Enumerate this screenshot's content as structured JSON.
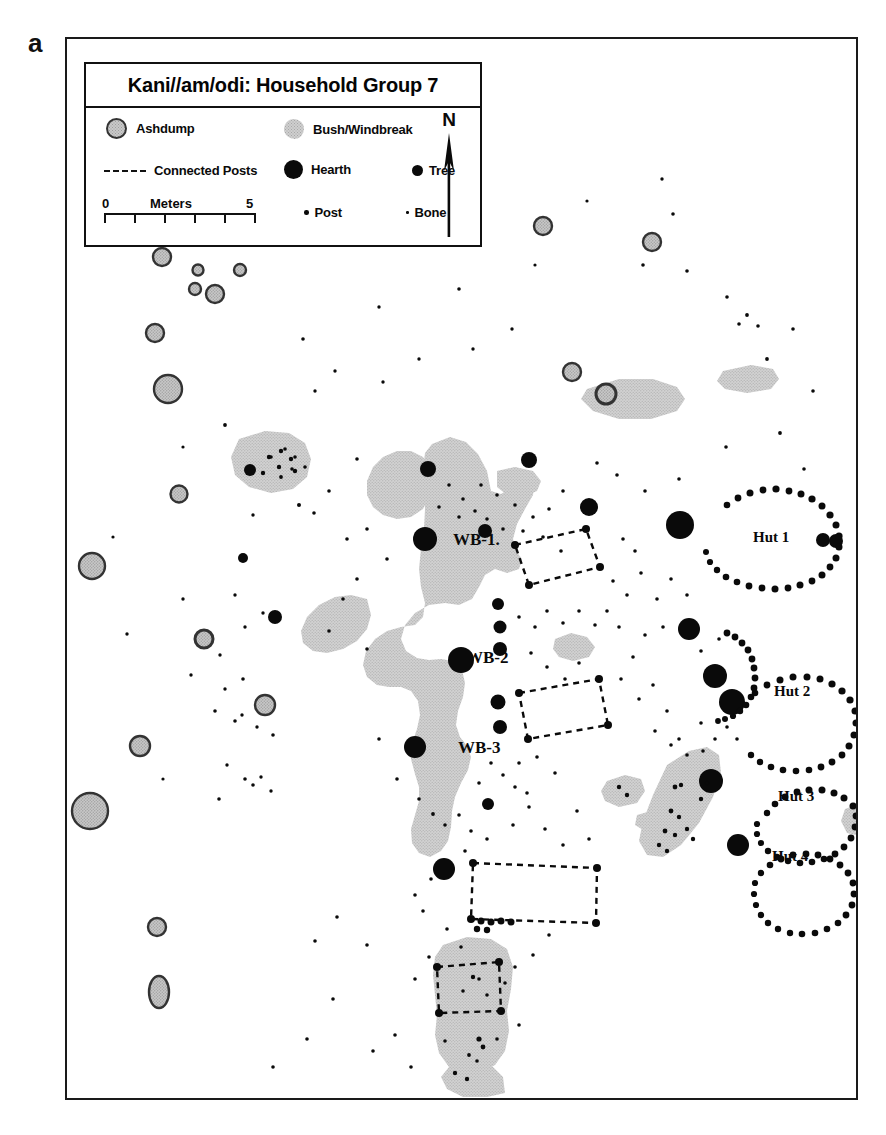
{
  "figure": {
    "panel_letter": "a"
  },
  "legend": {
    "title": "Kani//am/odi:  Household Group 7",
    "items": [
      {
        "key": "ashdump",
        "label": "Ashdump",
        "icon": "filled-gray-circle-outlined-icon"
      },
      {
        "key": "bush",
        "label": "Bush/Windbreak",
        "icon": "gray-blob-icon"
      },
      {
        "key": "connected_posts",
        "label": "Connected Posts",
        "icon": "dashed-line-icon"
      },
      {
        "key": "hearth",
        "label": "Hearth",
        "icon": "large-black-circle-icon"
      },
      {
        "key": "tree",
        "label": "Tree",
        "icon": "medium-black-circle-icon"
      },
      {
        "key": "post",
        "label": "Post",
        "icon": "small-black-dot-icon"
      },
      {
        "key": "bone",
        "label": "Bone",
        "icon": "tiny-black-dot-icon"
      }
    ],
    "scale": {
      "min_label": "0",
      "max_label": "5",
      "unit_label": "Meters",
      "ticks": [
        0,
        1,
        2,
        3,
        4,
        5
      ]
    },
    "north": {
      "letter": "N",
      "icon": "north-arrow-icon"
    }
  },
  "map": {
    "feature_labels": [
      {
        "text": "WB-1.",
        "x": 425,
        "y": 537
      },
      {
        "text": "WB-2",
        "x": 437,
        "y": 655
      },
      {
        "text": "WB-3",
        "x": 429,
        "y": 745
      },
      {
        "text": "Hut 1",
        "x": 725,
        "y": 534
      },
      {
        "text": "Hut 2",
        "x": 746,
        "y": 688
      },
      {
        "text": "Hut 3",
        "x": 770,
        "y": 793
      },
      {
        "text": "Hut 4",
        "x": 764,
        "y": 853
      }
    ],
    "colors": {
      "ink": "#0a0a0a",
      "frame": "#1a1a1a",
      "ashdump_fill": "#c9c9c9",
      "ashdump_stroke": "#333333",
      "bush_fill": "#cfcfcf",
      "background": "#ffffff"
    },
    "counts": {
      "huts": 4,
      "windbreaks": 3
    }
  }
}
